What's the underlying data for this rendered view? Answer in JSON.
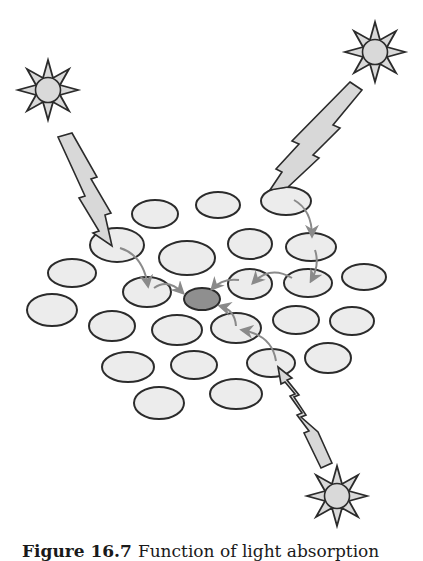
{
  "figure": {
    "caption_label": "Figure 16.7",
    "caption_text": "Function of light absorption",
    "colors": {
      "background": "#ffffff",
      "outline": "#2b2b2b",
      "antenna_fill": "#ececec",
      "reaction_center_fill": "#8f8f8f",
      "sun_fill": "#d9d9d9",
      "bolt_fill": "#d8d8d8",
      "arrow": "#8a8a8a"
    }
  },
  "suns": [
    {
      "id": "sun-top-left",
      "cx": 48,
      "cy": 90
    },
    {
      "id": "sun-top-right",
      "cx": 375,
      "cy": 52
    },
    {
      "id": "sun-bottom",
      "cx": 337,
      "cy": 496
    }
  ],
  "reaction_center": {
    "cx": 202,
    "cy": 299,
    "rx": 18,
    "ry": 11
  },
  "antenna_pigments": [
    {
      "cx": 155,
      "cy": 214,
      "rx": 23,
      "ry": 14
    },
    {
      "cx": 218,
      "cy": 205,
      "rx": 22,
      "ry": 13
    },
    {
      "cx": 286,
      "cy": 201,
      "rx": 25,
      "ry": 14
    },
    {
      "cx": 117,
      "cy": 245,
      "rx": 27,
      "ry": 17
    },
    {
      "cx": 187,
      "cy": 258,
      "rx": 28,
      "ry": 17
    },
    {
      "cx": 250,
      "cy": 244,
      "rx": 22,
      "ry": 15
    },
    {
      "cx": 311,
      "cy": 247,
      "rx": 25,
      "ry": 14
    },
    {
      "cx": 72,
      "cy": 273,
      "rx": 24,
      "ry": 14
    },
    {
      "cx": 147,
      "cy": 292,
      "rx": 24,
      "ry": 15
    },
    {
      "cx": 250,
      "cy": 284,
      "rx": 22,
      "ry": 15
    },
    {
      "cx": 308,
      "cy": 283,
      "rx": 24,
      "ry": 14
    },
    {
      "cx": 364,
      "cy": 277,
      "rx": 22,
      "ry": 13
    },
    {
      "cx": 52,
      "cy": 310,
      "rx": 25,
      "ry": 16
    },
    {
      "cx": 112,
      "cy": 326,
      "rx": 23,
      "ry": 15
    },
    {
      "cx": 177,
      "cy": 330,
      "rx": 25,
      "ry": 15
    },
    {
      "cx": 236,
      "cy": 328,
      "rx": 25,
      "ry": 15
    },
    {
      "cx": 296,
      "cy": 320,
      "rx": 23,
      "ry": 14
    },
    {
      "cx": 352,
      "cy": 321,
      "rx": 22,
      "ry": 14
    },
    {
      "cx": 128,
      "cy": 367,
      "rx": 26,
      "ry": 15
    },
    {
      "cx": 194,
      "cy": 365,
      "rx": 23,
      "ry": 14
    },
    {
      "cx": 271,
      "cy": 363,
      "rx": 24,
      "ry": 14
    },
    {
      "cx": 328,
      "cy": 358,
      "rx": 23,
      "ry": 15
    },
    {
      "cx": 159,
      "cy": 403,
      "rx": 25,
      "ry": 16
    },
    {
      "cx": 236,
      "cy": 394,
      "rx": 26,
      "ry": 15
    }
  ],
  "energy_transfer_paths": [
    {
      "id": "path-left-1",
      "from": [
        120,
        248
      ],
      "to": [
        149,
        285
      ]
    },
    {
      "id": "path-left-2",
      "from": [
        154,
        287
      ],
      "to": [
        183,
        295
      ]
    },
    {
      "id": "path-right-1",
      "from": [
        295,
        200
      ],
      "to": [
        313,
        235
      ]
    },
    {
      "id": "path-right-2",
      "from": [
        315,
        248
      ],
      "to": [
        310,
        280
      ]
    },
    {
      "id": "path-right-3",
      "from": [
        293,
        277
      ],
      "to": [
        253,
        283
      ]
    },
    {
      "id": "path-right-4",
      "from": [
        238,
        279
      ],
      "to": [
        212,
        290
      ]
    },
    {
      "id": "path-bottom-1",
      "from": [
        276,
        362
      ],
      "to": [
        241,
        331
      ]
    },
    {
      "id": "path-bottom-2",
      "from": [
        236,
        326
      ],
      "to": [
        220,
        306
      ]
    }
  ]
}
